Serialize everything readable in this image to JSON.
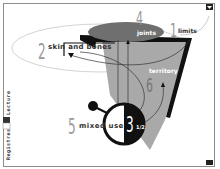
{
  "diagram": {
    "colors": {
      "ellipse_fill": "#6f6f6f",
      "cone_fill": "#a9a9a9",
      "black": "#111111",
      "number_gray": "#9a9a9a",
      "orbit_stroke": "#bdbdbd"
    },
    "nodes": [
      {
        "number": "1",
        "label": "limits"
      },
      {
        "number": "2",
        "label": "skin and bones"
      },
      {
        "number": "3",
        "fraction": "1/2",
        "label": ""
      },
      {
        "number": "4",
        "label": "joints"
      },
      {
        "number": "5",
        "label": "mixed use"
      },
      {
        "number": "6",
        "label": "territory"
      }
    ],
    "side_tabs": {
      "top": "Lecture",
      "bottom": "Registres"
    },
    "corner_icons": [
      "corner-marker-top-right",
      "corner-marker-bottom-right"
    ]
  }
}
